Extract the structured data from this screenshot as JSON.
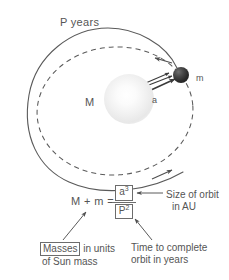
{
  "figure": {
    "orbit": {
      "period_label": "P years",
      "central_mass_label": "M",
      "orbiting_mass_label": "m",
      "semimajor_axis_label": "a"
    },
    "equation": {
      "left_side": "M + m =",
      "numerator_base": "a",
      "numerator_exponent": "3",
      "denominator_base": "P",
      "denominator_exponent": "2"
    },
    "annotations": {
      "numerator": {
        "line1": "Size of orbit",
        "line2": "in AU"
      },
      "denominator": {
        "line1": "Time to complete",
        "line2": "orbit in years"
      },
      "masses": {
        "boxed": "Masses",
        "line1_rest": " in units",
        "line2": "of Sun mass"
      }
    },
    "colors": {
      "ink": "#555555",
      "line": "#6c6c6c",
      "planet": "#2b2b2b",
      "star": "#f1f1f1",
      "background": "#ffffff"
    }
  }
}
